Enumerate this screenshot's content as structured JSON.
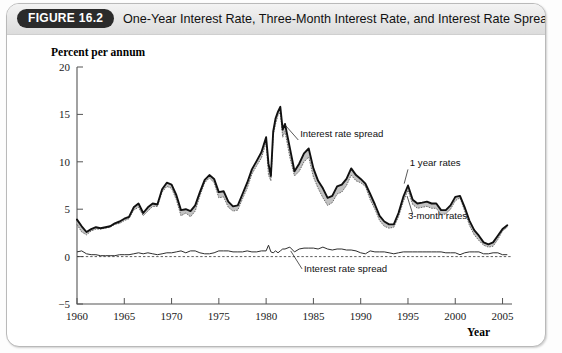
{
  "figure": {
    "badge": "FIGURE 16.2",
    "title": "One-Year Interest Rate, Three-Month Interest Rate, and Interest Rate Spread"
  },
  "chart_data": {
    "type": "line",
    "title": "One-Year Interest Rate, Three-Month Interest Rate, and Interest Rate Spread",
    "xlabel": "Year",
    "ylabel": "Percent per annum",
    "xlim": [
      1960,
      2006
    ],
    "ylim": [
      -5,
      20
    ],
    "yticks": [
      -5,
      0,
      5,
      10,
      15,
      20
    ],
    "xticks": [
      1960,
      1965,
      1970,
      1975,
      1980,
      1985,
      1990,
      1995,
      2000,
      2005
    ],
    "grid": false,
    "legend": "inline-annotations",
    "zero_reference_line": 0,
    "annotations": [
      {
        "text": "Interest rate spread",
        "x": 1983.6,
        "y": 12.6
      },
      {
        "text": "1 year rates",
        "x": 1995.2,
        "y": 9.6
      },
      {
        "text": "3-month rates",
        "x": 1995.0,
        "y": 4.0
      },
      {
        "text": "Interest rate spread",
        "x": 1984.0,
        "y": -1.6
      }
    ],
    "x": [
      1960,
      1960.5,
      1961,
      1961.5,
      1962,
      1962.5,
      1963,
      1963.5,
      1964,
      1964.5,
      1965,
      1965.5,
      1966,
      1966.5,
      1967,
      1967.5,
      1968,
      1968.5,
      1969,
      1969.5,
      1970,
      1970.5,
      1971,
      1971.5,
      1972,
      1972.5,
      1973,
      1973.5,
      1974,
      1974.5,
      1975,
      1975.5,
      1976,
      1976.5,
      1977,
      1977.5,
      1978,
      1978.5,
      1979,
      1979.5,
      1980,
      1980.25,
      1980.5,
      1980.75,
      1981,
      1981.25,
      1981.5,
      1981.75,
      1982,
      1982.5,
      1983,
      1983.5,
      1984,
      1984.5,
      1985,
      1985.5,
      1986,
      1986.5,
      1987,
      1987.5,
      1988,
      1988.5,
      1989,
      1989.5,
      1990,
      1990.5,
      1991,
      1991.5,
      1992,
      1992.5,
      1993,
      1993.5,
      1994,
      1994.5,
      1995,
      1995.5,
      1996,
      1996.5,
      1997,
      1997.5,
      1998,
      1998.5,
      1999,
      1999.5,
      2000,
      2000.5,
      2001,
      2001.5,
      2002,
      2002.5,
      2003,
      2003.5,
      2004,
      2004.5,
      2005,
      2005.5
    ],
    "series": [
      {
        "name": "1 year rates",
        "values": [
          3.9,
          3.2,
          2.6,
          2.9,
          3.1,
          3.0,
          3.1,
          3.2,
          3.5,
          3.7,
          4.0,
          4.2,
          5.2,
          5.6,
          4.6,
          5.2,
          5.6,
          5.5,
          7.1,
          7.8,
          7.6,
          6.5,
          4.9,
          5.0,
          4.8,
          5.4,
          6.8,
          8.1,
          8.6,
          8.2,
          6.8,
          6.9,
          5.8,
          5.3,
          5.4,
          6.6,
          7.8,
          9.2,
          10.1,
          11.0,
          12.6,
          9.8,
          8.5,
          13.2,
          14.6,
          15.3,
          15.8,
          13.4,
          14.0,
          11.5,
          9.0,
          9.8,
          10.9,
          11.4,
          9.3,
          8.0,
          7.2,
          6.2,
          6.4,
          7.4,
          7.6,
          8.2,
          9.3,
          8.6,
          8.2,
          7.7,
          6.6,
          5.5,
          4.3,
          3.7,
          3.4,
          3.4,
          4.6,
          6.3,
          7.5,
          6.0,
          5.6,
          5.7,
          5.8,
          5.6,
          5.6,
          4.9,
          4.9,
          5.4,
          6.3,
          6.4,
          5.2,
          3.8,
          2.8,
          2.2,
          1.5,
          1.3,
          1.5,
          2.2,
          2.9,
          3.3
        ]
      },
      {
        "name": "3-month rates",
        "values": [
          3.4,
          2.6,
          2.3,
          2.7,
          2.9,
          2.9,
          3.0,
          3.1,
          3.4,
          3.5,
          3.8,
          4.0,
          4.9,
          5.2,
          4.3,
          4.8,
          5.3,
          5.3,
          6.8,
          7.4,
          7.2,
          6.0,
          4.3,
          4.6,
          4.2,
          4.8,
          6.4,
          7.8,
          8.3,
          7.8,
          6.2,
          6.3,
          5.2,
          4.8,
          4.9,
          6.1,
          7.2,
          8.7,
          9.6,
          10.4,
          12.0,
          8.6,
          8.0,
          12.8,
          14.0,
          14.9,
          15.2,
          12.6,
          13.2,
          10.5,
          8.5,
          9.0,
          10.0,
          10.5,
          8.4,
          7.2,
          6.2,
          5.4,
          5.7,
          6.6,
          6.8,
          7.5,
          8.6,
          8.0,
          7.8,
          7.4,
          6.0,
          5.0,
          3.8,
          3.2,
          3.0,
          3.1,
          4.2,
          5.8,
          7.0,
          5.5,
          5.1,
          5.2,
          5.3,
          5.1,
          5.1,
          4.4,
          4.5,
          5.0,
          5.9,
          6.2,
          4.8,
          3.3,
          2.3,
          1.7,
          1.2,
          1.0,
          1.1,
          1.8,
          2.7,
          3.1
        ]
      },
      {
        "name": "Interest rate spread",
        "values": [
          0.5,
          0.6,
          0.3,
          0.2,
          0.2,
          0.1,
          0.1,
          0.1,
          0.1,
          0.2,
          0.2,
          0.2,
          0.3,
          0.4,
          0.3,
          0.4,
          0.3,
          0.2,
          0.3,
          0.4,
          0.4,
          0.5,
          0.6,
          0.4,
          0.6,
          0.6,
          0.4,
          0.3,
          0.3,
          0.4,
          0.6,
          0.6,
          0.6,
          0.5,
          0.5,
          0.5,
          0.6,
          0.5,
          0.5,
          0.6,
          0.6,
          1.2,
          0.5,
          0.4,
          0.6,
          0.4,
          0.6,
          0.8,
          0.8,
          1.0,
          0.5,
          0.8,
          0.9,
          0.9,
          0.9,
          0.8,
          1.0,
          0.8,
          0.7,
          0.8,
          0.8,
          0.7,
          0.7,
          0.6,
          0.4,
          0.3,
          0.6,
          0.5,
          0.5,
          0.5,
          0.4,
          0.3,
          0.4,
          0.5,
          0.5,
          0.5,
          0.5,
          0.5,
          0.5,
          0.5,
          0.5,
          0.5,
          0.4,
          0.4,
          0.4,
          0.2,
          0.4,
          0.5,
          0.5,
          0.5,
          0.3,
          0.3,
          0.4,
          0.4,
          0.2,
          0.2
        ]
      }
    ]
  }
}
